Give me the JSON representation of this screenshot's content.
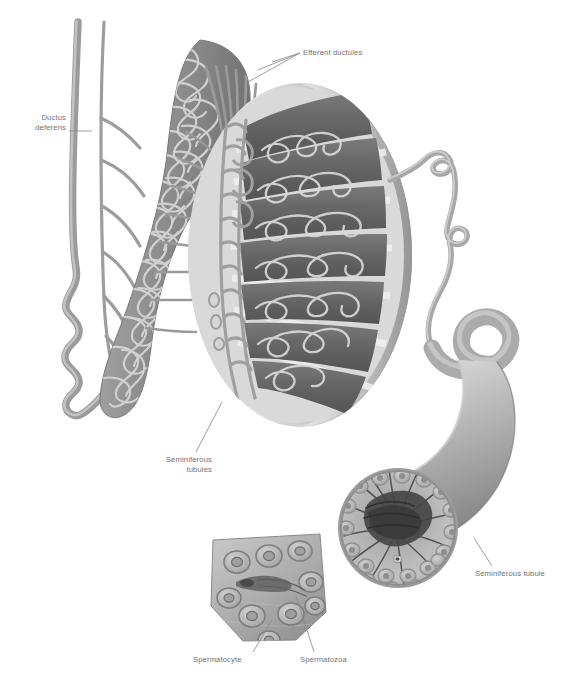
{
  "figure": {
    "style": "grayscale medical illustration",
    "background_color": "#ffffff",
    "label_color": "#6f6f6f",
    "leader_color": "#8d8d8d"
  },
  "labels": {
    "ductus_deferens": "Ductus\ndeferens",
    "efferent_ductules": "Efferent ductules",
    "seminiferous_tubules": "Seminiferous\ntubules",
    "seminiferous_tubule": "Seminiferous tubule",
    "spermatocyte": "Spermatocyte",
    "spermatozoa": "Spermatozoa"
  },
  "structures": {
    "ductus_deferens": "wavy duct descending at far left",
    "epididymis": "curved band of densely coiled tubule arching over the testis",
    "efferent_ductules": "fan of fine ducts linking epididymis head to rete testis",
    "rete_testis": "vertical mesh of anastomosing channels at the mediastinum",
    "testis_lobules": "dark wedge lobules containing coiled seminiferous tubules",
    "tunica_albuginea": "pale capsule forming the intact right rim of the testis",
    "unravelled_tubule": "single tubule uncoiling from the testis into a wide cylinder",
    "tubule_cross_section": "cut end of the wide tubule showing radiating spermatozoa tails",
    "wedge_segment": "magnified wedge of tubule wall with spermatocyte cells"
  },
  "colors": {
    "lobule_dark": "#6b6b6b",
    "lobule_darker": "#575757",
    "septum_light": "#d6d6d6",
    "capsule": "#b4b4b4",
    "tube_mid": "#9a9a9a",
    "tube_light": "#c9c9c9",
    "cell_fill": "#b9b9b9",
    "cell_ring": "#8a8a8a",
    "tail_dark": "#4a4a4a"
  }
}
